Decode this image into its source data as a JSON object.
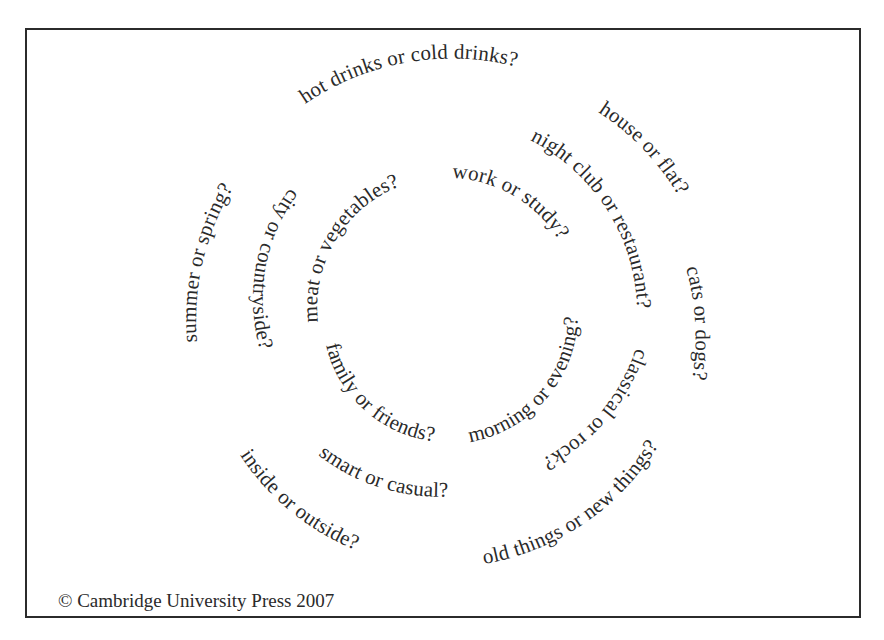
{
  "worksheet": {
    "title": "Preferences spiral",
    "questions": {
      "outer": [
        {
          "id": "hot-drinks",
          "text": "hot drinks or cold drinks?"
        },
        {
          "id": "house-flat",
          "text": "house or flat?"
        },
        {
          "id": "cats-dogs",
          "text": "cats or dogs?"
        },
        {
          "id": "old-new-things",
          "text": "old things or new things?"
        },
        {
          "id": "inside-outside",
          "text": "inside or outside?"
        },
        {
          "id": "summer-spring",
          "text": "summer or spring?"
        }
      ],
      "middle": [
        {
          "id": "nightclub-restaurant",
          "text": "night club or restaurant?"
        },
        {
          "id": "classical-rock",
          "text": "classical or rock?"
        },
        {
          "id": "smart-casual",
          "text": "smart or casual?"
        },
        {
          "id": "city-countryside",
          "text": "city or countryside?"
        }
      ],
      "inner": [
        {
          "id": "work-study",
          "text": "work or study?"
        },
        {
          "id": "morning-evening",
          "text": "morning or evening?"
        },
        {
          "id": "family-friends",
          "text": "family or friends?"
        },
        {
          "id": "meat-vegetables",
          "text": "meat or vegetables?"
        }
      ]
    },
    "footer": {
      "copyright": "© Cambridge University Press 2007"
    },
    "colors": {
      "text": "#2a2a2a",
      "border": "#2b2b2b",
      "background": "#ffffff"
    }
  }
}
